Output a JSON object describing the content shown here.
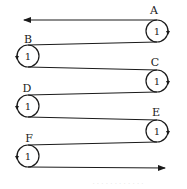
{
  "diagram": {
    "type": "winding-path",
    "stroke_color": "#1a1a1a",
    "background": "#ffffff",
    "nodes": [
      {
        "label": "A",
        "value": "1",
        "side": "right"
      },
      {
        "label": "B",
        "value": "1",
        "side": "left"
      },
      {
        "label": "C",
        "value": "1",
        "side": "right"
      },
      {
        "label": "D",
        "value": "1",
        "side": "left"
      },
      {
        "label": "E",
        "value": "1",
        "side": "right"
      },
      {
        "label": "F",
        "value": "1",
        "side": "left"
      }
    ],
    "start_arrow": "left",
    "end_arrow": "right",
    "caption": "· · · · · · · · · · · ·"
  }
}
